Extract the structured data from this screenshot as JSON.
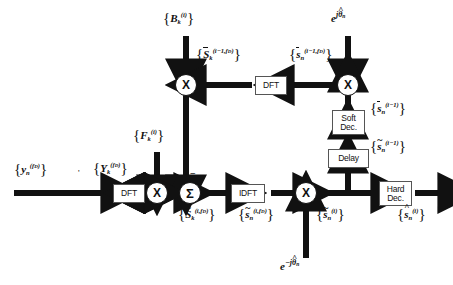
{
  "diagram": {
    "stroke_color": "#111111",
    "box_border_color": "#555555",
    "background": "#ffffff"
  },
  "blocks": [
    {
      "id": "dft_in",
      "label": "DFT",
      "x": 113,
      "y": 186,
      "w": 32,
      "h": 20
    },
    {
      "id": "dft_fb",
      "label": "DFT",
      "x": 255,
      "y": 75,
      "w": 32,
      "h": 20
    },
    {
      "id": "idft",
      "label": "IDFT",
      "x": 237,
      "y": 183,
      "w": 34,
      "h": 20
    },
    {
      "id": "soft_dec",
      "label": "Soft\nDec.",
      "x": 340,
      "y": 110,
      "w": 34,
      "h": 24
    },
    {
      "id": "delay",
      "label": "Delay",
      "x": 337,
      "y": 148,
      "w": 40,
      "h": 20
    },
    {
      "id": "hard_dec",
      "label": "Hard\nDec.",
      "x": 381,
      "y": 182,
      "w": 34,
      "h": 24
    }
  ],
  "nodes": [
    {
      "id": "mul_in",
      "type": "multiplier",
      "symbol": "X",
      "x": 156,
      "y": 185
    },
    {
      "id": "sum",
      "type": "summation",
      "symbol": "Σ",
      "x": 190,
      "y": 185
    },
    {
      "id": "mul_out",
      "type": "multiplier",
      "symbol": "X",
      "x": 305,
      "y": 185
    },
    {
      "id": "mul_top",
      "type": "multiplier",
      "symbol": "X",
      "x": 175,
      "y": 75
    },
    {
      "id": "mul_rot",
      "type": "multiplier",
      "symbol": "X",
      "x": 347,
      "y": 75
    }
  ],
  "sum_signs": {
    "left": "+",
    "top": "−"
  },
  "labels": {
    "input_y": {
      "base": "y",
      "sub": "n",
      "sup": "(f",
      "sup_tail": ")",
      "text": "{ y_n^(f_D) }"
    },
    "input_Y": {
      "text": "{ Y_k^(f_D) }"
    },
    "coef_F": {
      "text": "{ F_k^(i) }"
    },
    "coef_B": {
      "text": "{ B_k^(i) }"
    },
    "sbar_k_prev": {
      "text": "{ S̄_k^(i-1,f_D) }"
    },
    "sbar_n_prev": {
      "text": "{ s̄_n^(i-1,f_D) }"
    },
    "sbar_n_i1": {
      "text": "{ s̄_n^(i-1) }"
    },
    "stil_n_i1": {
      "text": "{ s̃_n^(i-1) }"
    },
    "Stil_k_i_fd": {
      "text": "{ S̃_k^(i,f_D) }"
    },
    "stil_n_i_fd": {
      "text": "{ s̃_n^(i,f_D) }"
    },
    "stil_n_i": {
      "text": "{ s̃_n^(i) }"
    },
    "shat_n_i": {
      "text": "{ ŝ_n^(i) }"
    },
    "exp_pos": {
      "text": "e^{jθ̂_n}"
    },
    "exp_neg": {
      "text": "e^{-jθ̂_n}"
    }
  }
}
